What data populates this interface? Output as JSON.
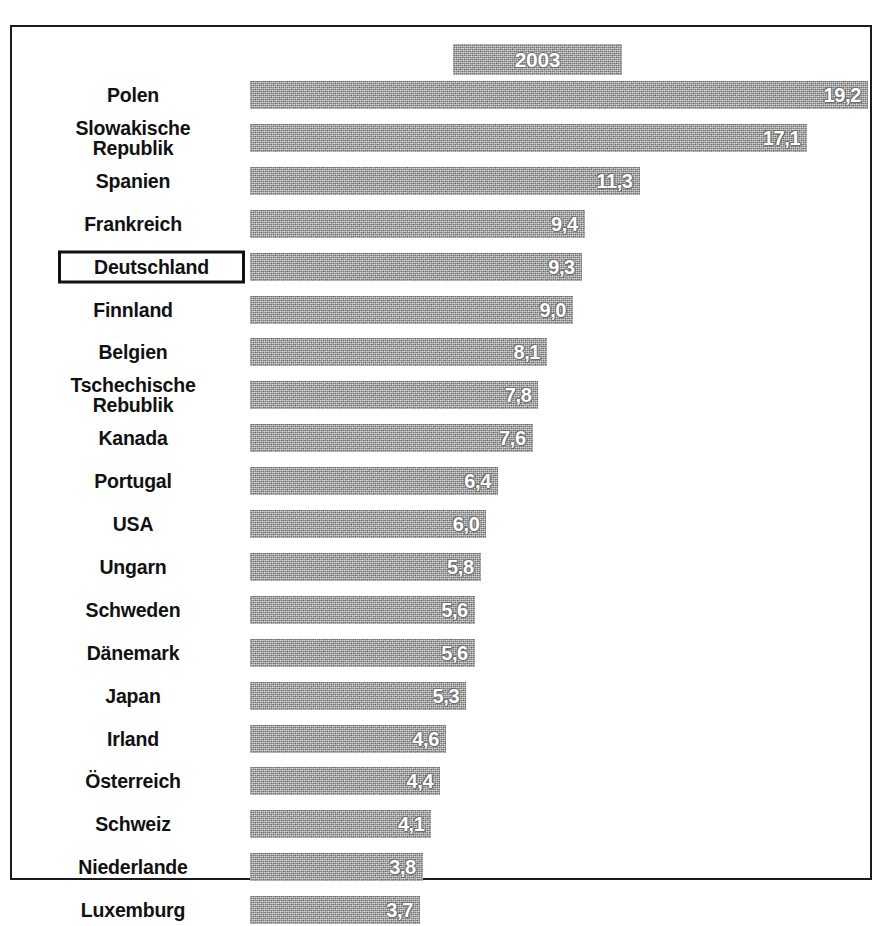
{
  "legend": {
    "label": "2003",
    "swatch_color": "#a2a2a2",
    "text_color": "#ffffff"
  },
  "frame": {
    "border_color": "#1b1b1b",
    "background": "#ffffff"
  },
  "highlight": {
    "category": "Deutschland",
    "box_border_color": "#111111"
  },
  "chart_data": {
    "type": "bar",
    "orientation": "horizontal",
    "title": "",
    "subtitle": "",
    "xlabel": "",
    "ylabel": "",
    "legend_position": "top-center",
    "grid": false,
    "axis_visible": false,
    "value_labels_inside_bars": true,
    "decimal_separator": ",",
    "series_name": "2003",
    "xlim": [
      0,
      20
    ],
    "categories": [
      "Polen",
      "Slowakische Republik",
      "Spanien",
      "Frankreich",
      "Deutschland",
      "Finnland",
      "Belgien",
      "Tschechische Rebublik",
      "Kanada",
      "Portugal",
      "USA",
      "Ungarn",
      "Schweden",
      "Dänemark",
      "Japan",
      "Irland",
      "Österreich",
      "Schweiz",
      "Niederlande",
      "Luxemburg"
    ],
    "values": [
      19.2,
      17.1,
      11.3,
      9.4,
      9.3,
      9.0,
      8.1,
      7.8,
      7.6,
      6.4,
      6.0,
      5.8,
      5.6,
      5.6,
      5.3,
      4.6,
      4.4,
      4.1,
      3.8,
      3.7
    ],
    "value_labels": [
      "19,2",
      "17,1",
      "11,3",
      "9,4",
      "9,3",
      "9,0",
      "8,1",
      "7,8",
      "7,6",
      "6,4",
      "6,0",
      "5,8",
      "5,6",
      "5,6",
      "5,3",
      "4,6",
      "4,4",
      "4,1",
      "3,8",
      "3,7"
    ]
  },
  "rows": [
    {
      "label_line1": "Polen",
      "label_line2": "",
      "value_label": "19,2",
      "value": 19.2
    },
    {
      "label_line1": "Slowakische",
      "label_line2": "Republik",
      "value_label": "17,1",
      "value": 17.1
    },
    {
      "label_line1": "Spanien",
      "label_line2": "",
      "value_label": "11,3",
      "value": 11.3
    },
    {
      "label_line1": "Frankreich",
      "label_line2": "",
      "value_label": "9,4",
      "value": 9.4
    },
    {
      "label_line1": "Deutschland",
      "label_line2": "",
      "value_label": "9,3",
      "value": 9.3
    },
    {
      "label_line1": "Finnland",
      "label_line2": "",
      "value_label": "9,0",
      "value": 9.0
    },
    {
      "label_line1": "Belgien",
      "label_line2": "",
      "value_label": "8,1",
      "value": 8.1
    },
    {
      "label_line1": "Tschechische",
      "label_line2": "Rebublik",
      "value_label": "7,8",
      "value": 7.8
    },
    {
      "label_line1": "Kanada",
      "label_line2": "",
      "value_label": "7,6",
      "value": 7.6
    },
    {
      "label_line1": "Portugal",
      "label_line2": "",
      "value_label": "6,4",
      "value": 6.4
    },
    {
      "label_line1": "USA",
      "label_line2": "",
      "value_label": "6,0",
      "value": 6.0
    },
    {
      "label_line1": "Ungarn",
      "label_line2": "",
      "value_label": "5,8",
      "value": 5.8
    },
    {
      "label_line1": "Schweden",
      "label_line2": "",
      "value_label": "5,6",
      "value": 5.6
    },
    {
      "label_line1": "Dänemark",
      "label_line2": "",
      "value_label": "5,6",
      "value": 5.6
    },
    {
      "label_line1": "Japan",
      "label_line2": "",
      "value_label": "5,3",
      "value": 5.3
    },
    {
      "label_line1": "Irland",
      "label_line2": "",
      "value_label": "4,6",
      "value": 4.6
    },
    {
      "label_line1": "Österreich",
      "label_line2": "",
      "value_label": "4,4",
      "value": 4.4
    },
    {
      "label_line1": "Schweiz",
      "label_line2": "",
      "value_label": "4,1",
      "value": 4.1
    },
    {
      "label_line1": "Niederlande",
      "label_line2": "",
      "value_label": "3,8",
      "value": 3.8
    },
    {
      "label_line1": "Luxemburg",
      "label_line2": "",
      "value_label": "3,7",
      "value": 3.7
    }
  ],
  "geometry": {
    "row_top_start": 52,
    "row_pitch": 42.9,
    "bar_px_per_unit": 28.9,
    "bar_px_offset": 63
  }
}
